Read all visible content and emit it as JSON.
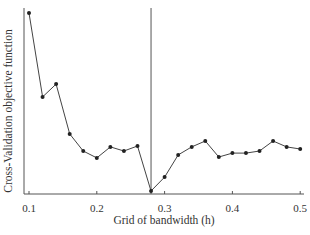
{
  "chart_data": {
    "type": "line",
    "title": "",
    "xlabel": "Grid of bandwidth (h)",
    "ylabel": "Cross-Validation objective function",
    "x_ticks": [
      0.1,
      0.2,
      0.3,
      0.4,
      0.5
    ],
    "x_tick_labels": [
      "0.1",
      "0.2",
      "0.3",
      "0.4",
      "0.5"
    ],
    "xlim": [
      0.1,
      0.5
    ],
    "ylim": [
      0,
      100
    ],
    "y_ticks_shown": false,
    "grid": false,
    "legend": null,
    "annotations": [
      {
        "type": "vertical_line",
        "x": 0.28,
        "note": "minimum CV bandwidth"
      }
    ],
    "series": [
      {
        "name": "CV objective",
        "marker": "circle",
        "color": "#333333",
        "x": [
          0.1,
          0.12,
          0.14,
          0.16,
          0.18,
          0.2,
          0.22,
          0.24,
          0.26,
          0.28,
          0.3,
          0.32,
          0.34,
          0.36,
          0.38,
          0.4,
          0.42,
          0.44,
          0.46,
          0.48,
          0.5
        ],
        "values": [
          97.3,
          52.2,
          59.1,
          32.3,
          23.1,
          19.4,
          25.3,
          23.1,
          25.8,
          1.6,
          9.1,
          21.0,
          25.3,
          28.5,
          19.9,
          22.0,
          22.0,
          23.1,
          28.5,
          25.3,
          24.2
        ]
      }
    ]
  }
}
